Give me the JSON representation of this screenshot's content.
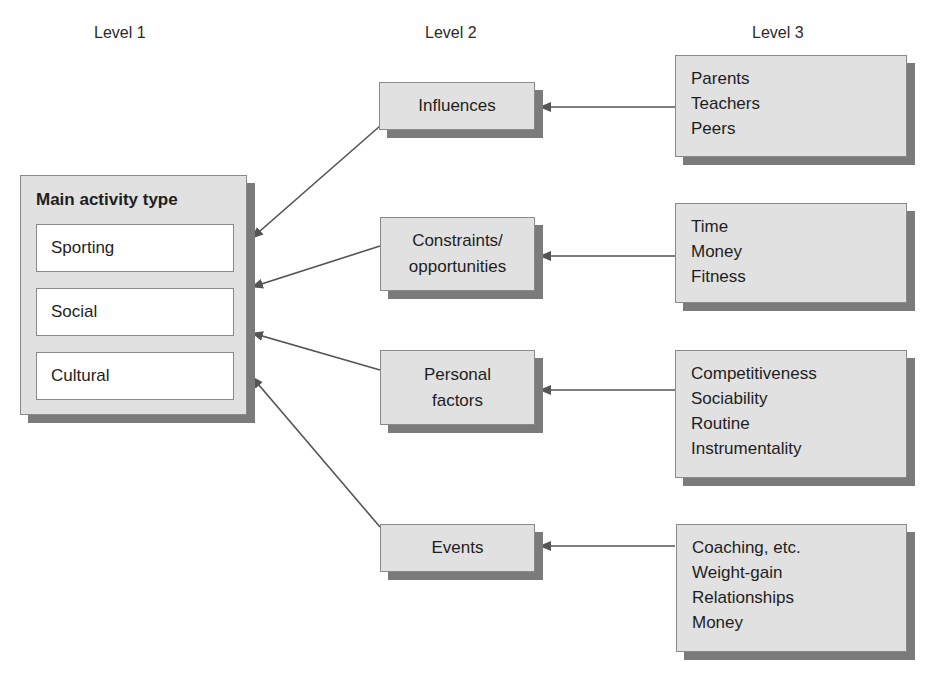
{
  "headers": {
    "level1": "Level 1",
    "level2": "Level 2",
    "level3": "Level 3"
  },
  "main": {
    "title": "Main activity type",
    "items": [
      "Sporting",
      "Social",
      "Cultural"
    ]
  },
  "level2": [
    {
      "label": "Influences"
    },
    {
      "label": "Constraints/\nopportunities"
    },
    {
      "label": "Personal\nfactors"
    },
    {
      "label": "Events"
    }
  ],
  "level3": [
    {
      "items": [
        "Parents",
        "Teachers",
        "Peers"
      ]
    },
    {
      "items": [
        "Time",
        "Money",
        "Fitness"
      ]
    },
    {
      "items": [
        "Competitiveness",
        "Sociability",
        "Routine",
        "Instrumentality"
      ]
    },
    {
      "items": [
        "Coaching, etc.",
        "Weight-gain",
        "Relationships",
        "Money"
      ]
    }
  ],
  "colors": {
    "box_fill": "#e1e1e1",
    "shadow": "#7b7b7b",
    "border": "#8a8a8a",
    "line": "#555555"
  }
}
